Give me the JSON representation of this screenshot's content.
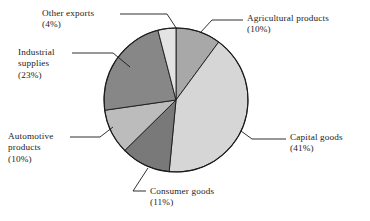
{
  "figure": {
    "title": "",
    "background": "#ffffff",
    "pie": {
      "center_x": 176,
      "center_y": 100,
      "radius": 72,
      "outline_color": "#1a1a1a",
      "start_angle_deg": 0
    }
  },
  "chart_data": {
    "type": "pie",
    "title": "",
    "unit": "%",
    "legend": "labels-with-leader-lines",
    "grid": false,
    "categories": [
      "Agricultural products",
      "Capital goods",
      "Consumer goods",
      "Automotive products",
      "Industrial supplies",
      "Other exports"
    ],
    "values": [
      10,
      41,
      11,
      10,
      23,
      4
    ],
    "colors": [
      "#a8a8a8",
      "#d6d6d6",
      "#797979",
      "#bcbcbc",
      "#878787",
      "#e3e3e3"
    ],
    "slices": [
      {
        "label": "Agricultural products",
        "value": 10,
        "pct_text": "(10%)",
        "color": "#a8a8a8"
      },
      {
        "label": "Capital goods",
        "value": 41,
        "pct_text": "(41%)",
        "color": "#d6d6d6"
      },
      {
        "label": "Consumer goods",
        "value": 11,
        "pct_text": "(11%)",
        "color": "#797979"
      },
      {
        "label": "Automotive products",
        "value": 10,
        "pct_text": "(10%)",
        "color": "#bcbcbc"
      },
      {
        "label": "Industrial supplies",
        "value": 23,
        "pct_text": "(23%)",
        "color": "#878787"
      },
      {
        "label": "Other exports",
        "value": 4,
        "pct_text": "(4%)",
        "color": "#e3e3e3"
      }
    ]
  },
  "labels": {
    "agricultural": {
      "line1": "Agricultural products",
      "pct": "(10%)"
    },
    "capital": {
      "line1": "Capital goods",
      "pct": "(41%)"
    },
    "consumer": {
      "line1": "Consumer goods",
      "pct": "(11%)"
    },
    "automotive": {
      "line1": "Automotive",
      "line2": "products",
      "pct": "(10%)"
    },
    "industrial": {
      "line1": "Industrial",
      "line2": "supplies",
      "pct": "(23%)"
    },
    "other": {
      "line1": "Other exports",
      "pct": "(4%)"
    }
  }
}
